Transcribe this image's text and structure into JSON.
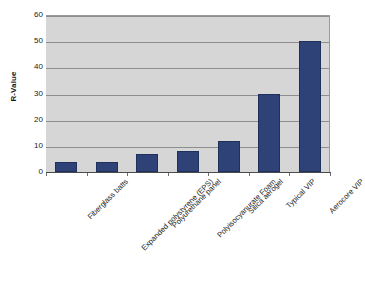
{
  "chart_data": {
    "type": "bar",
    "title": "",
    "xlabel": "",
    "ylabel": "R-Value",
    "ylim": [
      0,
      60
    ],
    "yticks": [
      0,
      10,
      20,
      30,
      40,
      50,
      60
    ],
    "ytick_labels": [
      "0",
      "10",
      "20",
      "30",
      "40",
      "50",
      "60"
    ],
    "grid": true,
    "legend": "none",
    "bar_color": "#2f4278",
    "plot_background": "#d6d6d6",
    "categories": [
      "Fiberglass batts",
      "Expanded polystyrene (EPS)",
      "Polyurethane panel",
      "Polyisocyanurate Foam",
      "Silica aerogel",
      "Typical VIP",
      "Aerocore VIP"
    ],
    "values": [
      4,
      4,
      7,
      8,
      12,
      30,
      50
    ],
    "series": [
      {
        "name": "R-Value",
        "values": [
          4,
          4,
          7,
          8,
          12,
          30,
          50
        ]
      }
    ]
  }
}
